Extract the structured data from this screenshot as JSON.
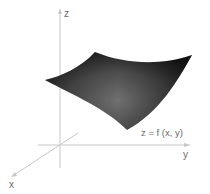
{
  "figure": {
    "axes": {
      "x_label": "x",
      "y_label": "y",
      "z_label": "z"
    },
    "surface_label": "z = f (x, y)",
    "colors": {
      "axis": "#c8c8c8",
      "label": "#6a6a6a",
      "surface_dark": "#1e1e1e",
      "surface_light": "#6e6e6e",
      "background": "#ffffff"
    }
  }
}
